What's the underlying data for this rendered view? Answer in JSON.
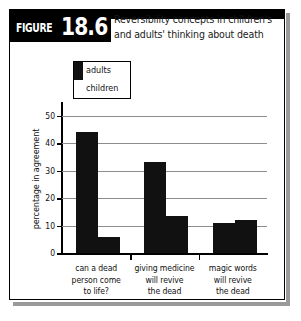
{
  "figure": {
    "label_word": "FIGURE",
    "label_number": "18.6",
    "title_line1": "Reversibility concepts in children's",
    "title_line2": "and adults' thinking about death"
  },
  "chart_data": {
    "type": "bar",
    "title": "Reversibility concepts in children's and adults' thinking about death",
    "xlabel": "",
    "ylabel": "percentage in agreement",
    "ylim": [
      0,
      55
    ],
    "yticks": [
      0,
      10,
      20,
      30,
      40,
      50
    ],
    "ytick_labels": [
      "0",
      "10",
      "20",
      "30",
      "40",
      "50"
    ],
    "grid": true,
    "legend_position": "top-left-inside",
    "categories": [
      "can a dead person come to life?",
      "giving medicine will revive the dead",
      "magic words will revive the dead"
    ],
    "category_lines": [
      [
        "can a dead",
        "person come",
        "to life?"
      ],
      [
        "giving medicine",
        "will revive",
        "the dead"
      ],
      [
        "magic words",
        "will revive",
        "the dead"
      ]
    ],
    "series": [
      {
        "name": "adults",
        "color": "#111111",
        "values": [
          44,
          33,
          11
        ]
      },
      {
        "name": "children",
        "color": "#111111",
        "values": [
          6,
          13.5,
          12
        ]
      }
    ]
  },
  "legend": {
    "items": [
      {
        "label": "adults",
        "swatch": "black"
      },
      {
        "label": "children",
        "swatch": "white"
      }
    ]
  }
}
